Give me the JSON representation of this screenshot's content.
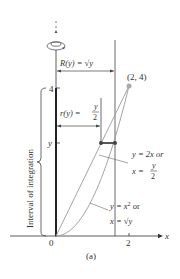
{
  "figure": {
    "caption": "(a)",
    "axes": {
      "x_label": "x",
      "y_label": "y",
      "origin_label": "0",
      "x_tick": "2",
      "y_tick_top": "4",
      "y_tick_var": "y"
    },
    "outer_radius": "R(y) = √y",
    "inner_radius_lhs": "r(y) =",
    "inner_radius_num": "y",
    "inner_radius_den": "2",
    "point_label": "(2, 4)",
    "line_label_1": "y = 2x or",
    "line_label_2_lhs": "x =",
    "line_label_2_num": "y",
    "line_label_2_den": "2",
    "curve_label_1": "y = x",
    "curve_label_1_exp": "2",
    "curve_label_1_tail": " or",
    "curve_label_2": "x = √y",
    "interval_label": "Interval of integration",
    "colors": {
      "axis": "#333333",
      "curve": "#9a9a9a",
      "rod": "#444444"
    }
  }
}
